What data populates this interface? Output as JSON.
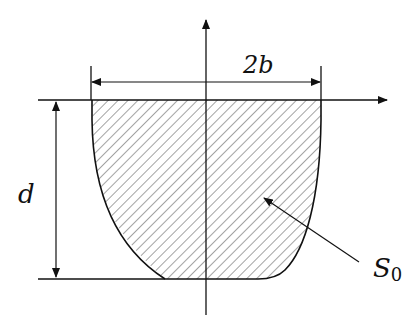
{
  "diagram": {
    "type": "cross-section",
    "labels": {
      "width": "2b",
      "depth": "d",
      "area": "S",
      "area_subscript": "0"
    },
    "colors": {
      "stroke": "#111111",
      "hatch": "#333333",
      "background": "#ffffff"
    }
  }
}
